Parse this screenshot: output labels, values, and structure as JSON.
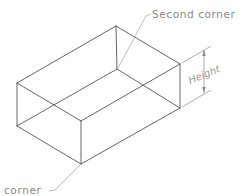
{
  "diagram": {
    "type": "isometric-box",
    "labels": {
      "second_corner": "Second corner",
      "first_corner": "corner",
      "height": "Height"
    },
    "colors": {
      "edges": "#555555",
      "annotations": "#8a8a8a"
    }
  }
}
